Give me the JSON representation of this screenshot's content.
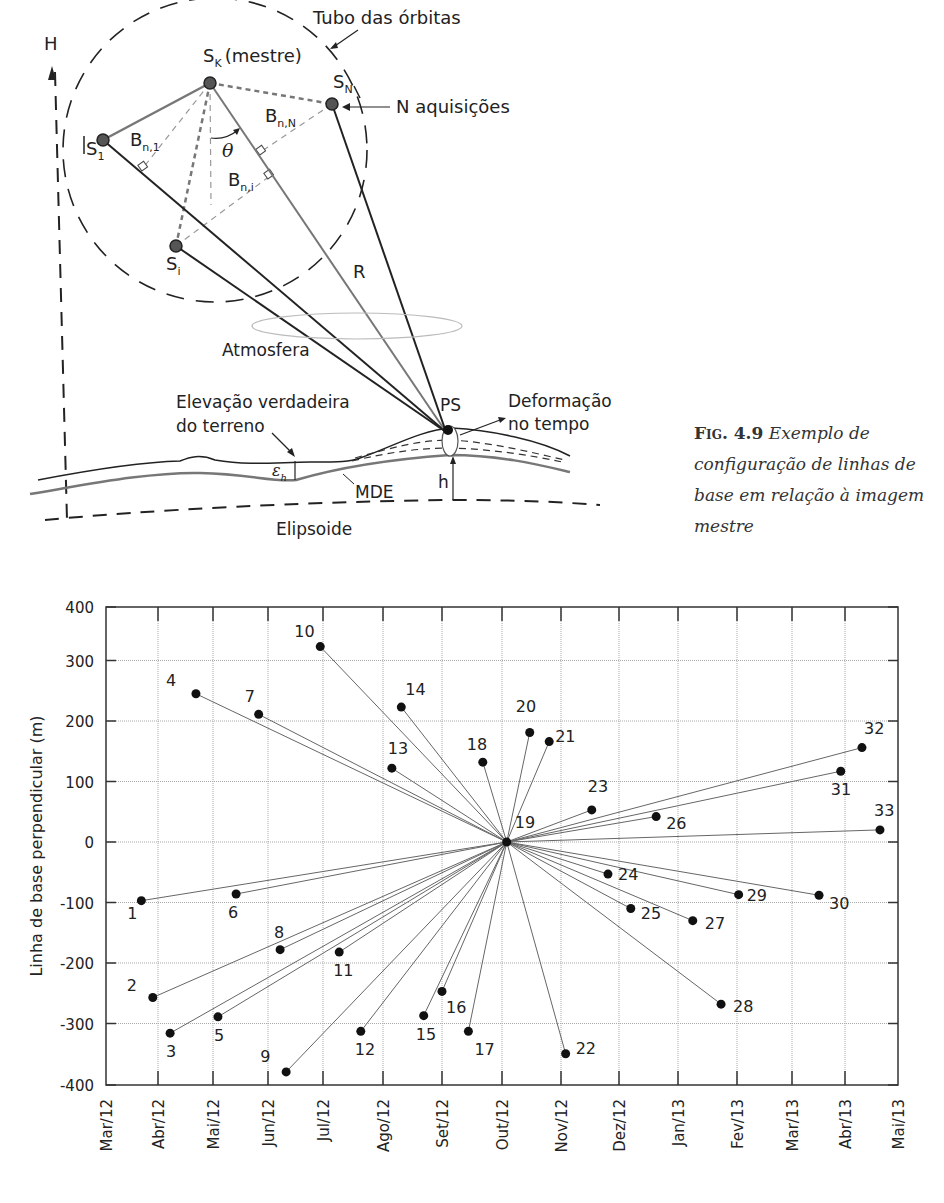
{
  "diagram": {
    "axis_label_H": "H",
    "orbit_tube_label": "Tubo das órbitas",
    "master_label": "S",
    "master_sub": "K",
    "master_suffix": "(mestre)",
    "sn_label": "S",
    "sn_sub": "N",
    "n_acq_label": "N aquisições",
    "s1_label": "S",
    "s1_sub": "1",
    "si_label": "S",
    "si_sub": "i",
    "bn1_label": "B",
    "bn1_sub": "n,1",
    "bnN_label": "B",
    "bnN_sub": "n,N",
    "bni_label": "B",
    "bni_sub": "n,i",
    "theta_label": "θ",
    "range_label": "R",
    "atmosphere_label": "Atmosfera",
    "ps_label": "PS",
    "deformation_label_1": "Deformação",
    "deformation_label_2": "no tempo",
    "true_elev_label_1": "Elevação verdadeira",
    "true_elev_label_2": "do terreno",
    "eps_label": "ε",
    "eps_sub": "h",
    "mde_label": "MDE",
    "h_label": "h",
    "ellipsoid_label": "Elipsoide"
  },
  "caption": {
    "fig_num": "Fig. 4.9",
    "text": "Exemplo de configuração de linhas de base em relação à imagem mestre"
  },
  "chart_data": {
    "type": "scatter",
    "title": "",
    "xlabel": "",
    "ylabel": "Linha de base perpendicular (m)",
    "ylim": [
      -400,
      400
    ],
    "yticks": [
      400,
      300,
      200,
      100,
      0,
      -100,
      -200,
      -300,
      -400
    ],
    "xticks": [
      "Mar/12",
      "Abr/12",
      "Mai/12",
      "Jun/12",
      "Jul/12",
      "Ago/12",
      "Set/12",
      "Out/12",
      "Nov/12",
      "Dez/12",
      "Jan/13",
      "Fev/13",
      "Mar/13",
      "Abr/13",
      "Mai/13"
    ],
    "grid": true,
    "master_index": 19,
    "note": "Each acquisition is connected by a line to master image 19",
    "points": [
      {
        "id": 1,
        "month": 0.68,
        "bperp": -97
      },
      {
        "id": 2,
        "month": 0.9,
        "bperp": -257
      },
      {
        "id": 3,
        "month": 1.22,
        "bperp": -316
      },
      {
        "id": 4,
        "month": 1.69,
        "bperp": 245
      },
      {
        "id": 5,
        "month": 2.09,
        "bperp": -289
      },
      {
        "id": 6,
        "month": 2.42,
        "bperp": -86
      },
      {
        "id": 7,
        "month": 2.83,
        "bperp": 211
      },
      {
        "id": 8,
        "month": 3.22,
        "bperp": -178
      },
      {
        "id": 9,
        "month": 3.33,
        "bperp": -380
      },
      {
        "id": 10,
        "month": 3.95,
        "bperp": 323
      },
      {
        "id": 11,
        "month": 4.27,
        "bperp": -182
      },
      {
        "id": 12,
        "month": 4.63,
        "bperp": -313
      },
      {
        "id": 13,
        "month": 5.15,
        "bperp": 122
      },
      {
        "id": 14,
        "month": 5.31,
        "bperp": 223
      },
      {
        "id": 15,
        "month": 5.69,
        "bperp": -287
      },
      {
        "id": 16,
        "month": 6.0,
        "bperp": -247
      },
      {
        "id": 17,
        "month": 6.44,
        "bperp": -313
      },
      {
        "id": 18,
        "month": 6.68,
        "bperp": 132
      },
      {
        "id": 19,
        "month": 7.08,
        "bperp": 0
      },
      {
        "id": 20,
        "month": 7.47,
        "bperp": 181
      },
      {
        "id": 21,
        "month": 7.8,
        "bperp": 166
      },
      {
        "id": 22,
        "month": 8.08,
        "bperp": -350
      },
      {
        "id": 23,
        "month": 8.53,
        "bperp": 53
      },
      {
        "id": 24,
        "month": 8.81,
        "bperp": -53
      },
      {
        "id": 25,
        "month": 9.2,
        "bperp": -110
      },
      {
        "id": 26,
        "month": 9.63,
        "bperp": 42
      },
      {
        "id": 27,
        "month": 10.25,
        "bperp": -130
      },
      {
        "id": 28,
        "month": 10.73,
        "bperp": -268
      },
      {
        "id": 29,
        "month": 11.03,
        "bperp": -87
      },
      {
        "id": 30,
        "month": 12.51,
        "bperp": -88
      },
      {
        "id": 31,
        "month": 12.92,
        "bperp": 117
      },
      {
        "id": 32,
        "month": 13.32,
        "bperp": 156
      },
      {
        "id": 33,
        "month": 13.66,
        "bperp": 20
      }
    ]
  },
  "chart_layout": {
    "left": 106,
    "right": 898,
    "top": 607,
    "bottom": 1085,
    "x_tick_px": [
      106,
      158,
      213,
      268,
      323,
      383,
      442,
      502,
      561,
      619,
      678,
      737,
      792,
      845,
      898
    ],
    "y_zero_px": 842,
    "y_px_per_100": 60.5
  },
  "label_offsets": {
    "1": [
      -14,
      18
    ],
    "2": [
      -26,
      -6
    ],
    "3": [
      -4,
      24
    ],
    "4": [
      -30,
      -8
    ],
    "5": [
      -4,
      24
    ],
    "6": [
      -8,
      24
    ],
    "7": [
      -14,
      -12
    ],
    "8": [
      -6,
      -12
    ],
    "9": [
      -26,
      -10
    ],
    "10": [
      -26,
      -10
    ],
    "11": [
      -6,
      24
    ],
    "12": [
      -6,
      24
    ],
    "13": [
      -4,
      -14
    ],
    "14": [
      4,
      -12
    ],
    "15": [
      -8,
      24
    ],
    "16": [
      4,
      22
    ],
    "17": [
      6,
      24
    ],
    "18": [
      -16,
      -12
    ],
    "19": [
      8,
      -14
    ],
    "20": [
      -14,
      -20
    ],
    "21": [
      6,
      0
    ],
    "22": [
      10,
      0
    ],
    "23": [
      -4,
      -18
    ],
    "24": [
      10,
      6
    ],
    "25": [
      10,
      10
    ],
    "26": [
      10,
      12
    ],
    "27": [
      12,
      8
    ],
    "28": [
      12,
      8
    ],
    "29": [
      8,
      6
    ],
    "30": [
      10,
      14
    ],
    "31": [
      -10,
      24
    ],
    "32": [
      2,
      -14
    ],
    "33": [
      -6,
      -14
    ]
  }
}
